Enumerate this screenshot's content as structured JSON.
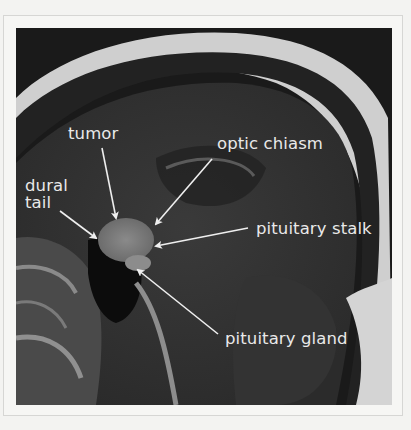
{
  "figure": {
    "labels": {
      "tumor": "tumor",
      "optic_chiasm": "optic chiasm",
      "dural_tail_line1": "dural",
      "dural_tail_line2": "tail",
      "pituitary_stalk": "pituitary stalk",
      "pituitary_gland": "pituitary gland"
    },
    "colors": {
      "background": "#f3f3f1",
      "image_bg": "#1a1a1a",
      "label_text": "#e9e9e9",
      "arrow": "#efefef"
    }
  }
}
